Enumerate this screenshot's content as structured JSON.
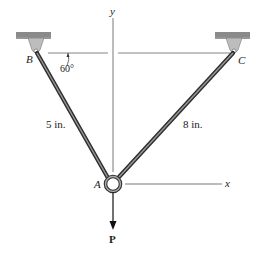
{
  "figure": {
    "labels": {
      "y_axis": "y",
      "x_axis": "x",
      "point_a": "A",
      "point_b": "B",
      "point_c": "C",
      "angle": "60°",
      "length_ab": "5 in.",
      "length_ac": "8 in.",
      "force": "P"
    },
    "colors": {
      "rod": "#3a3a3a",
      "rod_highlight": "#9a9a9a",
      "support_bracket": "#b8b8b8",
      "ground_hatch": "#8a8a8a",
      "axis_line": "#555555"
    }
  }
}
